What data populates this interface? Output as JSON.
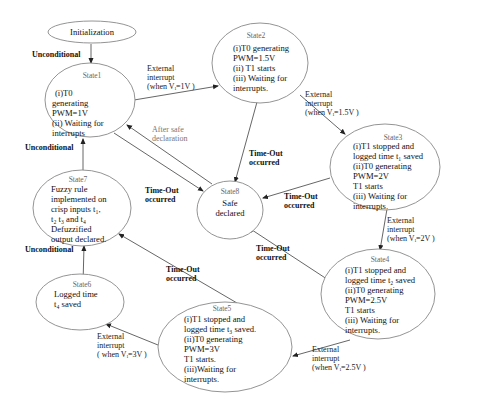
{
  "diagram": {
    "type": "state-machine",
    "nodes": {
      "init": {
        "title": "",
        "lines": [
          "Initialization"
        ]
      },
      "state1": {
        "title": "State1",
        "lines": [
          "(i)T0",
          "generating",
          "PWM=1V",
          "(ii) Waiting for",
          "interrupts"
        ]
      },
      "state2": {
        "title": "State2",
        "lines": [
          "(i)T0 generating",
          "PWM=1.5V",
          "(ii) T1 starts",
          "(iii) Waiting for",
          "interrupts."
        ]
      },
      "state3": {
        "title": "State3",
        "lines": [
          "(i)T1 stopped and",
          "logged time t₁ saved",
          "(ii)T0 generating",
          "PWM=2V",
          "T1 starts",
          "(iii) Waiting for",
          "interrupts."
        ]
      },
      "state4": {
        "title": "State4",
        "lines": [
          "(i)T1 stopped and",
          "logged time t₂ saved",
          "(ii)T0 generating",
          "PWM=2.5V",
          "T1 starts",
          "(iii) Waiting for",
          "interrupts."
        ]
      },
      "state5": {
        "title": "State5",
        "lines": [
          "(i)T1 stopped and",
          "logged time t₃ saved.",
          "(ii)T0 generating",
          "PWM=3V",
          "T1 starts.",
          "(iii)Waiting for",
          "interrupts."
        ]
      },
      "state6": {
        "title": "State6",
        "lines": [
          "Logged time",
          "t₄ saved"
        ]
      },
      "state7": {
        "title": "State7",
        "lines": [
          "Fuzzy rule",
          "implemented on",
          "crisp inputs t₁,",
          "t₂ t₃ and t₄",
          "Defuzzified",
          "output declared."
        ]
      },
      "state8": {
        "title": "State8",
        "lines": [
          "Safe",
          "declared"
        ]
      }
    },
    "edges": {
      "init_to_1": {
        "from": "Initialization",
        "to": "State1",
        "label": [
          "Unconditional"
        ]
      },
      "s1_to_s2": {
        "from": "State1",
        "to": "State2",
        "label": [
          "External",
          "interrupt",
          "(when Vᵢ=1V )"
        ]
      },
      "s2_to_s3": {
        "from": "State2",
        "to": "State3",
        "label": [
          "External",
          "interrupt",
          "(when Vᵢ=1.5V )"
        ]
      },
      "s3_to_s4": {
        "from": "State3",
        "to": "State4",
        "label": [
          "External",
          "interrupt",
          "(when Vᵢ=2V )"
        ]
      },
      "s4_to_s5": {
        "from": "State4",
        "to": "State5",
        "label": [
          "External",
          "interrupt",
          "(when Vᵢ=2.5V )"
        ]
      },
      "s5_to_s6": {
        "from": "State5",
        "to": "State6",
        "label": [
          "External",
          "interrupt",
          "( when Vᵢ=3V )"
        ]
      },
      "s6_to_s7": {
        "from": "State6",
        "to": "State7",
        "label": [
          "Unconditional"
        ]
      },
      "s7_to_s1": {
        "from": "State7",
        "to": "State1",
        "label": [
          "Unconditional"
        ]
      },
      "s1_to_s8": {
        "from": "State1",
        "to": "State8",
        "label": [
          "Time-Out",
          "occurred"
        ]
      },
      "s2_to_s8": {
        "from": "State2",
        "to": "State8",
        "label": [
          "Time-Out",
          "occurred"
        ]
      },
      "s3_to_s8": {
        "from": "State3",
        "to": "State8",
        "label": [
          "Time-Out",
          "occurred"
        ]
      },
      "s4_to_s8": {
        "from": "State4",
        "to": "State8",
        "label": [
          "Time-Out",
          "occurred"
        ]
      },
      "s5_to_s7": {
        "from": "State5",
        "to": "State7",
        "label": [
          "Time-Out",
          "occurred"
        ]
      },
      "s8_to_s1": {
        "from": "State8",
        "to": "State1",
        "label": [
          "After safe",
          "declaration"
        ]
      }
    }
  }
}
